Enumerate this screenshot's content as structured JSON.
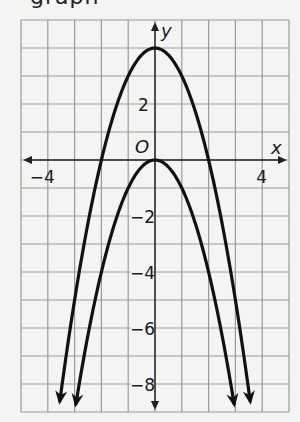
{
  "header": {
    "cut_text": "graph"
  },
  "chart_data": {
    "type": "line",
    "title": "",
    "xlabel": "x",
    "ylabel": "y",
    "origin_label": "O",
    "xlim": [
      -5,
      5
    ],
    "ylim": [
      -9,
      5
    ],
    "grid": true,
    "x_ticks": [
      {
        "value": -4,
        "label": "−4"
      },
      {
        "value": 4,
        "label": "4"
      }
    ],
    "y_ticks": [
      {
        "value": 2,
        "label": "2"
      },
      {
        "value": -2,
        "label": "−2"
      },
      {
        "value": -4,
        "label": "−4"
      },
      {
        "value": -6,
        "label": "−6"
      },
      {
        "value": -8,
        "label": "−8"
      }
    ],
    "series": [
      {
        "name": "upper parabola",
        "equation": "y = -x^2 + 4",
        "vertex": [
          0,
          4
        ],
        "x_intercepts": [
          -2,
          2
        ],
        "x_range": [
          -3.55,
          3.55
        ],
        "arrows_both_ends": true
      },
      {
        "name": "lower parabola",
        "equation": "y = -x^2",
        "vertex": [
          0,
          0
        ],
        "x_intercepts": [
          0
        ],
        "x_range": [
          -2.95,
          2.95
        ],
        "arrows_both_ends": true
      }
    ],
    "colors": {
      "grid": "#9a9a9a",
      "curve": "#111111",
      "axis": "#222222",
      "background": "#f4f4f2"
    }
  }
}
